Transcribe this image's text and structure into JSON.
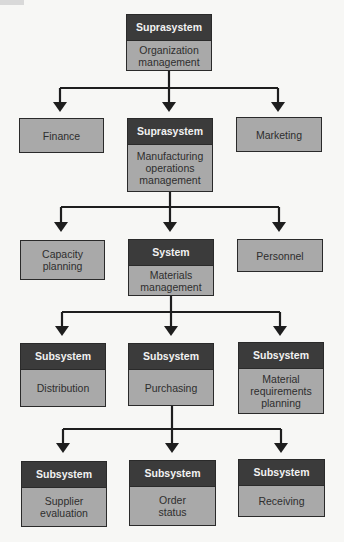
{
  "diagram": {
    "colors": {
      "header_bg": "#3b3b3b",
      "box_bg": "#a9a9a9",
      "line": "#1e1e1e",
      "background": "#f7f7f5"
    },
    "levels": [
      {
        "nodes": [
          {
            "id": "org",
            "header": "Suprasystem",
            "label": "Organization\nmanagement"
          }
        ]
      },
      {
        "nodes": [
          {
            "id": "finance",
            "header": null,
            "label": "Finance"
          },
          {
            "id": "mfg",
            "header": "Suprasystem",
            "label": "Manufacturing\noperations\nmanagement"
          },
          {
            "id": "marketing",
            "header": null,
            "label": "Marketing"
          }
        ]
      },
      {
        "nodes": [
          {
            "id": "capacity",
            "header": null,
            "label": "Capacity\nplanning"
          },
          {
            "id": "materials",
            "header": "System",
            "label": "Materials\nmanagement"
          },
          {
            "id": "personnel",
            "header": null,
            "label": "Personnel"
          }
        ]
      },
      {
        "nodes": [
          {
            "id": "distribution",
            "header": "Subsystem",
            "label": "Distribution"
          },
          {
            "id": "purchasing",
            "header": "Subsystem",
            "label": "Purchasing"
          },
          {
            "id": "mrp",
            "header": "Subsystem",
            "label": "Material\nrequirements\nplanning"
          }
        ]
      },
      {
        "nodes": [
          {
            "id": "supplier",
            "header": "Subsystem",
            "label": "Supplier\nevaluation"
          },
          {
            "id": "order",
            "header": "Subsystem",
            "label": "Order\nstatus"
          },
          {
            "id": "receiving",
            "header": "Subsystem",
            "label": "Receiving"
          }
        ]
      }
    ],
    "edges": [
      [
        "org",
        "finance"
      ],
      [
        "org",
        "mfg"
      ],
      [
        "org",
        "marketing"
      ],
      [
        "mfg",
        "capacity"
      ],
      [
        "mfg",
        "materials"
      ],
      [
        "mfg",
        "personnel"
      ],
      [
        "materials",
        "distribution"
      ],
      [
        "materials",
        "purchasing"
      ],
      [
        "materials",
        "mrp"
      ],
      [
        "purchasing",
        "supplier"
      ],
      [
        "purchasing",
        "order"
      ],
      [
        "purchasing",
        "receiving"
      ]
    ]
  }
}
